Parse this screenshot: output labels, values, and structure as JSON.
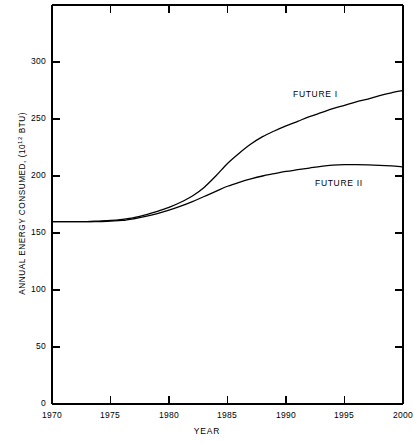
{
  "chart_data": {
    "type": "line",
    "title": "",
    "xlabel": "YEAR",
    "ylabel": "ANNUAL ENERGY CONSUMED,  (10¹² BTU)",
    "ylabel_main": "ANNUAL ENERGY CONSUMED,  (10",
    "ylabel_exp": "12",
    "ylabel_tail": " BTU)",
    "xlim": [
      1970,
      2000
    ],
    "ylim": [
      0,
      325
    ],
    "grid": false,
    "legend_position": "inline-annotation",
    "x_ticks": [
      1970,
      1975,
      1980,
      1985,
      1990,
      1995,
      2000
    ],
    "x_tick_labels": [
      "1970",
      "1975",
      "1980",
      "1985",
      "1990",
      "1995",
      "2000"
    ],
    "y_ticks": [
      0,
      50,
      100,
      150,
      200,
      250,
      300
    ],
    "y_tick_labels": [
      "0",
      "50",
      "100",
      "150",
      "200",
      "250",
      "300"
    ],
    "x": [
      1970,
      1971,
      1972,
      1973,
      1974,
      1975,
      1976,
      1977,
      1978,
      1979,
      1980,
      1981,
      1982,
      1983,
      1984,
      1985,
      1986,
      1987,
      1988,
      1989,
      1990,
      1991,
      1992,
      1993,
      1994,
      1995,
      1996,
      1997,
      1998,
      1999,
      2000
    ],
    "series": [
      {
        "name": "FUTURE I",
        "values": [
          160,
          160,
          160,
          160,
          160.5,
          161,
          162,
          163.5,
          166,
          169,
          172.5,
          177,
          182.5,
          190,
          200,
          211,
          220,
          228,
          234.5,
          239.5,
          244,
          248,
          252,
          255.5,
          259,
          262,
          265,
          267.5,
          270.5,
          273,
          275
        ]
      },
      {
        "name": "FUTURE II",
        "values": [
          160,
          160,
          160,
          160,
          160,
          160.5,
          161,
          162.5,
          164.5,
          167,
          170,
          173.5,
          177.5,
          182,
          186.5,
          191,
          194.5,
          197.5,
          200,
          202,
          204,
          205.5,
          207,
          208.5,
          209.5,
          210,
          210,
          209.8,
          209.4,
          208.8,
          208
        ]
      }
    ],
    "annotations": [
      {
        "text": "FUTURE I",
        "x": 1990,
        "y": 283
      },
      {
        "text": "FUTURE II",
        "x": 1994,
        "y": 203
      }
    ],
    "colors": {
      "line": "#000000",
      "axis": "#000000",
      "background": "#ffffff"
    }
  }
}
